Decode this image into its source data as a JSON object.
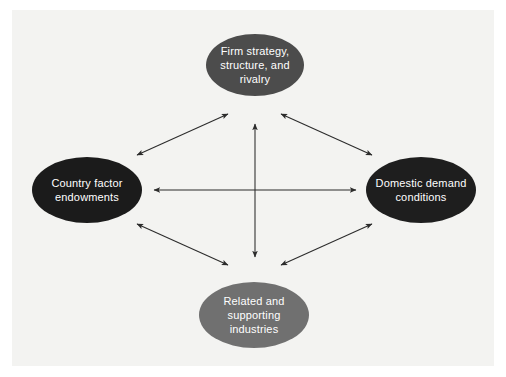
{
  "diagram": {
    "background_color": "#f3f3f1",
    "page_color": "#ffffff",
    "nodes": [
      {
        "id": "firm-strategy",
        "label": "Firm strategy, structure, and rivalry",
        "position": "top",
        "fill": "#4c4c4c",
        "text_color": "#ffffff"
      },
      {
        "id": "country-factors",
        "label": "Country factor endowments",
        "position": "left",
        "fill": "#1b1b1b",
        "text_color": "#ffffff"
      },
      {
        "id": "domestic-demand",
        "label": "Domestic demand conditions",
        "position": "right",
        "fill": "#1e1e1e",
        "text_color": "#ffffff"
      },
      {
        "id": "related-industries",
        "label": "Related and supporting industries",
        "position": "bottom",
        "fill": "#707070",
        "text_color": "#ffffff"
      }
    ],
    "connectors": [
      {
        "id": "left-top",
        "from": "country-factors",
        "to": "firm-strategy",
        "style": "double-headed",
        "orientation": "diagonal"
      },
      {
        "id": "top-right",
        "from": "firm-strategy",
        "to": "domestic-demand",
        "style": "double-headed",
        "orientation": "diagonal"
      },
      {
        "id": "left-bottom",
        "from": "country-factors",
        "to": "related-industries",
        "style": "double-headed",
        "orientation": "diagonal"
      },
      {
        "id": "bottom-right",
        "from": "related-industries",
        "to": "domestic-demand",
        "style": "double-headed",
        "orientation": "diagonal"
      },
      {
        "id": "left-right",
        "from": "country-factors",
        "to": "domestic-demand",
        "style": "double-headed",
        "orientation": "horizontal"
      },
      {
        "id": "top-bottom",
        "from": "firm-strategy",
        "to": "related-industries",
        "style": "double-headed",
        "orientation": "vertical"
      }
    ],
    "connector_color": "#2b2b2b",
    "artifacts": {
      "center_smudge": "",
      "bottom_smudge": ""
    }
  }
}
